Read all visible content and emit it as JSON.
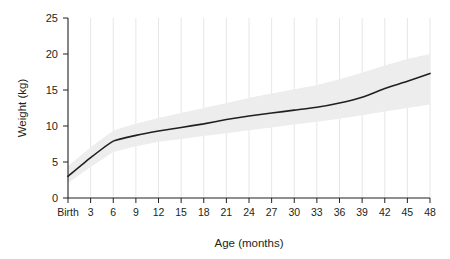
{
  "chart_data": {
    "type": "line",
    "title": "",
    "xlabel": "Age (months)",
    "ylabel": "Weight (kg)",
    "xlim": [
      0,
      48
    ],
    "ylim": [
      0,
      25
    ],
    "grid": "vertical",
    "legend": "none",
    "x": [
      0,
      3,
      6,
      9,
      12,
      15,
      18,
      21,
      24,
      27,
      30,
      33,
      36,
      39,
      42,
      45,
      48
    ],
    "xtick_labels": [
      "Birth",
      "3",
      "6",
      "9",
      "12",
      "15",
      "18",
      "21",
      "24",
      "27",
      "30",
      "33",
      "36",
      "39",
      "42",
      "45",
      "48"
    ],
    "ytick_labels": [
      "0",
      "5",
      "10",
      "15",
      "20",
      "25"
    ],
    "ytick_values": [
      0,
      5,
      10,
      15,
      20,
      25
    ],
    "series": [
      {
        "name": "median-weight",
        "color": "#231f20",
        "values": [
          3.0,
          5.6,
          7.9,
          8.7,
          9.3,
          9.8,
          10.3,
          10.9,
          11.4,
          11.8,
          12.2,
          12.6,
          13.2,
          14.0,
          15.2,
          16.2,
          17.3
        ]
      }
    ],
    "band": {
      "name": "normal-range-band",
      "color": "#ededed",
      "upper": [
        4.4,
        7.0,
        9.3,
        10.3,
        11.1,
        11.8,
        12.5,
        13.2,
        13.9,
        14.5,
        15.1,
        15.7,
        16.5,
        17.4,
        18.4,
        19.3,
        20.0
      ],
      "lower": [
        2.1,
        4.3,
        6.4,
        7.2,
        7.8,
        8.2,
        8.6,
        9.0,
        9.4,
        9.8,
        10.2,
        10.6,
        11.0,
        11.5,
        12.0,
        12.5,
        13.0
      ]
    }
  }
}
